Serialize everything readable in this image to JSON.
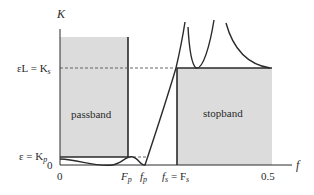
{
  "diagram": {
    "y_axis_label": "K",
    "x_axis_label": "f",
    "y_labels": {
      "stop_level": "εL = K",
      "stop_level_sub": "s",
      "pass_level": "ε = K",
      "pass_level_sub": "p",
      "zero": "0"
    },
    "x_labels": {
      "zero": "0",
      "Fp": "F",
      "Fp_sub": "p",
      "fp": "f",
      "fp_sub": "p",
      "fs_eq": "f",
      "fs_eq_sub": "s",
      "fs_eq_rhs": " = F",
      "fs_eq_rhs_sub": "s",
      "half": "0.5"
    },
    "regions": {
      "passband": "passband",
      "stopband": "stopband"
    },
    "colors": {
      "fill": "#dcdcdc",
      "line": "#2a2a2a",
      "dashed": "#555555"
    }
  }
}
